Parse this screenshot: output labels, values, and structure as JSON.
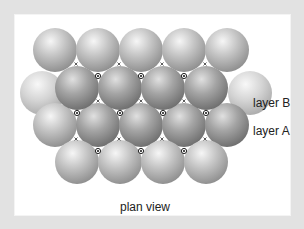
{
  "labels": {
    "layer_b": "layer B",
    "layer_a": "layer A",
    "caption": "plan view"
  },
  "colors": {
    "frame": "#e2e2e2",
    "panel": "#ffffff",
    "sphere_light": "#d6d6d6",
    "sphere_mid": "#9a9a9a",
    "sphere_dark": "#6e6e6e",
    "text": "#222222"
  },
  "diagram": {
    "sphere_radius": 22,
    "layer_a_rows": [
      {
        "y": 50,
        "x": [
          55,
          98,
          141,
          184,
          227
        ]
      },
      {
        "y": 88,
        "x": [
          55,
          248
        ]
      },
      {
        "y": 125,
        "x": [
          55,
          98,
          141,
          184,
          227
        ]
      },
      {
        "y": 162,
        "x": [
          77,
          120,
          163,
          206
        ]
      }
    ],
    "layer_b_rows": [
      {
        "y": 84,
        "x": [
          77,
          120,
          163,
          206
        ]
      }
    ],
    "octahedral_hole_markers": "dot",
    "tetrahedral_hole_markers": "x"
  }
}
